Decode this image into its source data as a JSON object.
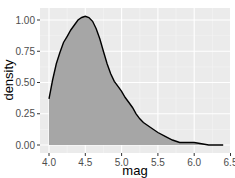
{
  "chart_data": {
    "type": "area",
    "title": "",
    "xlabel": "mag",
    "ylabel": "density",
    "xlim": [
      3.9,
      6.5
    ],
    "ylim": [
      -0.05,
      1.08
    ],
    "x_ticks": [
      "4.0",
      "4.5",
      "5.0",
      "5.5",
      "6.0",
      "6.5"
    ],
    "y_ticks": [
      "0.00",
      "0.25",
      "0.50",
      "0.75",
      "1.00"
    ],
    "grid": true,
    "legend": null,
    "series": [
      {
        "name": "density",
        "x": [
          4.0,
          4.05,
          4.1,
          4.15,
          4.2,
          4.25,
          4.3,
          4.35,
          4.4,
          4.45,
          4.5,
          4.55,
          4.6,
          4.65,
          4.7,
          4.75,
          4.8,
          4.85,
          4.9,
          4.95,
          5.0,
          5.05,
          5.1,
          5.15,
          5.2,
          5.25,
          5.3,
          5.4,
          5.5,
          5.6,
          5.7,
          5.8,
          5.9,
          6.0,
          6.1,
          6.2,
          6.3,
          6.4
        ],
        "values": [
          0.37,
          0.52,
          0.65,
          0.74,
          0.82,
          0.87,
          0.92,
          0.96,
          1.0,
          1.02,
          1.03,
          1.02,
          0.99,
          0.93,
          0.85,
          0.75,
          0.65,
          0.57,
          0.51,
          0.47,
          0.43,
          0.38,
          0.34,
          0.3,
          0.25,
          0.21,
          0.18,
          0.14,
          0.1,
          0.07,
          0.04,
          0.02,
          0.02,
          0.02,
          0.01,
          0.0,
          0.0,
          0.0
        ]
      }
    ],
    "fill_color": "#a6a6a6",
    "line_color": "#000000",
    "panel_color": "#ebebeb"
  }
}
